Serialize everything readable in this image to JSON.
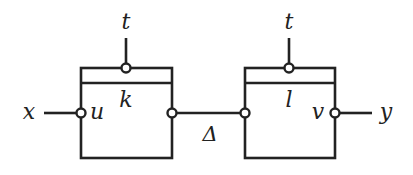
{
  "diagram": {
    "blocks": [
      {
        "id": "block-k",
        "label": "k",
        "input_port_label": "u",
        "control_label": "t"
      },
      {
        "id": "block-l",
        "label": "l",
        "output_port_label": "v",
        "control_label": "t"
      }
    ],
    "external_input_label": "x",
    "external_output_label": "y",
    "connection_label": "Δ",
    "colors": {
      "stroke": "#222222",
      "background": "#ffffff"
    }
  }
}
